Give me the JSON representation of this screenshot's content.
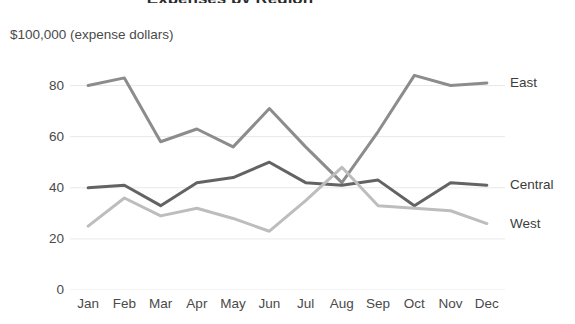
{
  "chart_data": {
    "type": "line",
    "title": "Expenses by Region",
    "subtitle": "",
    "ylabel": "$100,000 (expense dollars)",
    "xlabel": "",
    "categories": [
      "Jan",
      "Feb",
      "Mar",
      "Apr",
      "May",
      "Jun",
      "Jul",
      "Aug",
      "Sep",
      "Oct",
      "Nov",
      "Dec"
    ],
    "series": [
      {
        "name": "East",
        "color": "#8c8c8c",
        "values": [
          80,
          83,
          58,
          63,
          56,
          71,
          56,
          42,
          62,
          84,
          80,
          81
        ]
      },
      {
        "name": "Central",
        "color": "#636363",
        "values": [
          40,
          41,
          33,
          42,
          44,
          50,
          42,
          41,
          43,
          33,
          42,
          41
        ]
      },
      {
        "name": "West",
        "color": "#bdbdbd",
        "values": [
          25,
          36,
          29,
          32,
          28,
          23,
          35,
          48,
          33,
          32,
          31,
          26
        ]
      }
    ],
    "ylim": [
      0,
      90
    ],
    "yticks": [
      0,
      20,
      40,
      60,
      80
    ],
    "ytick_labels": [
      "0",
      "20",
      "40",
      "60",
      "80"
    ],
    "grid": true,
    "grid_color": "#e8e8e8",
    "legend_position": "right-inline",
    "background": "#ffffff"
  }
}
